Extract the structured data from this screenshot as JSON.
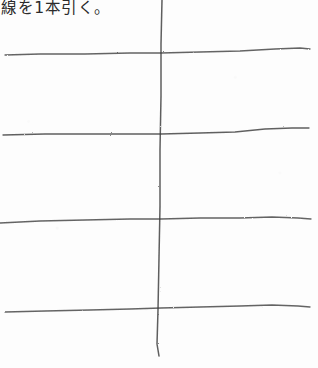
{
  "document": {
    "kind": "scanned-handwritten-worksheet",
    "width": 318,
    "height": 368,
    "paper_color": "#fdfdfd",
    "ink_color": "#3a3a3a"
  },
  "caption": {
    "text": "線を1本引く。",
    "position": "top-left"
  },
  "drawing": {
    "title": "線を1本引く。",
    "vertical_lines": [
      {
        "name": "vertical-stroke",
        "points": "162,0 161,44 161,96 160,150 160,206 159,258 158,310 157,344 159,356",
        "width": 1.5,
        "opacity": 0.82
      }
    ],
    "horizontal_lines": [
      {
        "name": "horizontal-stroke-1",
        "points": "5,55 40,54 85,54 130,53 161,53 200,52 240,51 275,49 300,48 310,49",
        "width": 1.3,
        "opacity": 0.78
      },
      {
        "name": "horizontal-stroke-2",
        "points": "3,135 45,134 90,134 130,134 161,134 200,133 235,132 265,129 292,128 309,128",
        "width": 1.3,
        "opacity": 0.8
      },
      {
        "name": "horizontal-stroke-3",
        "points": "0,223 40,221 85,220 130,219 161,219 200,218 240,218 272,217 298,218 311,219",
        "width": 1.3,
        "opacity": 0.78
      },
      {
        "name": "horizontal-stroke-4",
        "points": "5,312 45,311 90,310 130,309 161,308 200,307 240,306 272,305 298,306 310,307",
        "width": 1.3,
        "opacity": 0.78
      }
    ]
  }
}
